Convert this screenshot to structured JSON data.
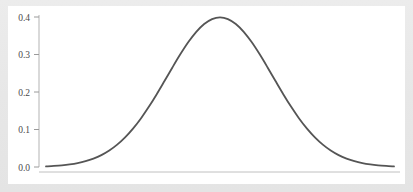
{
  "figure": {
    "background_color": "#ffffff",
    "frame_color": "#e9e9e9",
    "panel_border_color": "#d8d8d8"
  },
  "chart_data": {
    "type": "line",
    "title": "",
    "subtitle": "",
    "xlabel": "",
    "ylabel": "",
    "legend": [],
    "legend_position": "none",
    "grid": false,
    "line_color": "#555555",
    "line_width": 1.8,
    "axis_color": "#b0b0b0",
    "tick_color": "#9a9a9a",
    "tick_label_color": "#4a4a4a",
    "xlim": [
      -3.3,
      3.3
    ],
    "ylim": [
      0.0,
      0.42
    ],
    "x_tick_labels": [],
    "y_tick_labels": [
      "0.0",
      "0.1",
      "0.2",
      "0.3",
      "0.4"
    ],
    "y_ticks": [
      0.0,
      0.1,
      0.2,
      0.3,
      0.4
    ],
    "x": [
      -3.3,
      -3.15,
      -3.0,
      -2.85,
      -2.7,
      -2.55,
      -2.4,
      -2.25,
      -2.1,
      -1.95,
      -1.8,
      -1.65,
      -1.5,
      -1.35,
      -1.2,
      -1.05,
      -0.9,
      -0.75,
      -0.6,
      -0.45,
      -0.3,
      -0.15,
      0.0,
      0.15,
      0.3,
      0.45,
      0.6,
      0.75,
      0.9,
      1.05,
      1.2,
      1.35,
      1.5,
      1.65,
      1.8,
      1.95,
      2.1,
      2.25,
      2.4,
      2.55,
      2.7,
      2.85,
      3.0,
      3.15,
      3.3
    ],
    "values": [
      0.0017,
      0.0028,
      0.0044,
      0.0069,
      0.0104,
      0.0154,
      0.0224,
      0.0317,
      0.044,
      0.0596,
      0.079,
      0.1023,
      0.1295,
      0.1604,
      0.1942,
      0.2299,
      0.2661,
      0.3011,
      0.3332,
      0.3605,
      0.3814,
      0.3945,
      0.3989,
      0.3945,
      0.3814,
      0.3605,
      0.3332,
      0.3011,
      0.2661,
      0.2299,
      0.1942,
      0.1604,
      0.1295,
      0.1023,
      0.079,
      0.0596,
      0.044,
      0.0317,
      0.0224,
      0.0154,
      0.0104,
      0.0069,
      0.0044,
      0.0028,
      0.0017
    ],
    "peak_value": 0.3989,
    "peak_x": 0.0
  }
}
